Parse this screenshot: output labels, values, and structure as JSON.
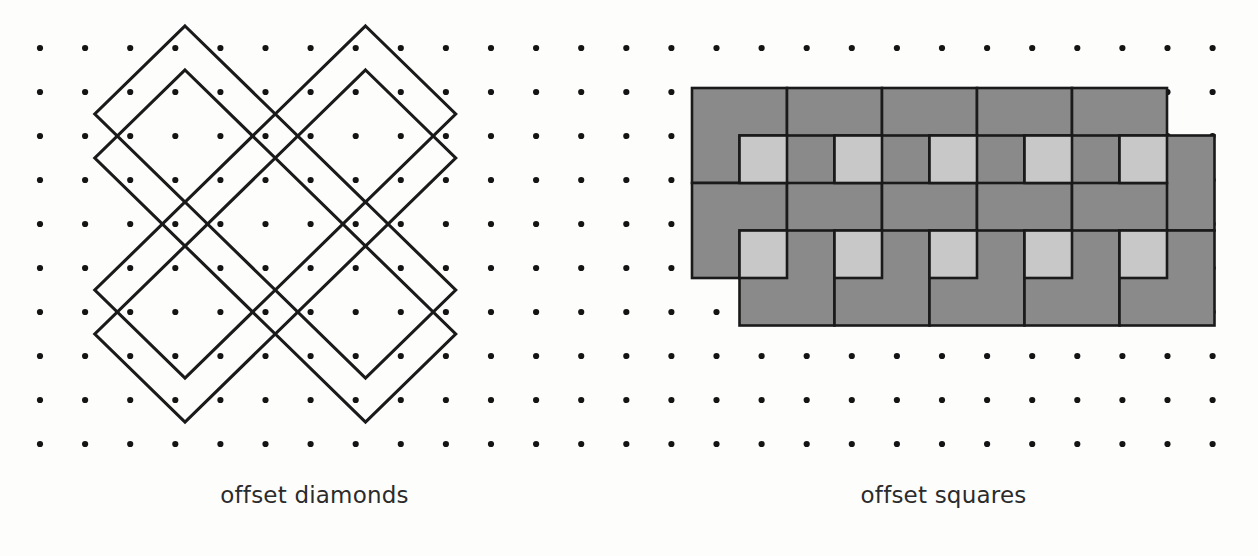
{
  "figure": {
    "background_color": "#fdfdfc",
    "panels": [
      {
        "id": "offset-diamonds",
        "caption": "offset diamonds",
        "kind": "line-drawing",
        "stroke_color": "#1a1a1a",
        "fill_color": "none"
      },
      {
        "id": "offset-squares",
        "caption": "offset squares",
        "kind": "filled-drawing",
        "stroke_color": "#1a1a1a",
        "fill_dark": "#8a8a8a",
        "fill_light": "#c8c8c8"
      }
    ]
  },
  "grid": {
    "dot_color": "#141414",
    "dot_radius": 3.1,
    "cols": 27,
    "rows": 10,
    "x0": 40,
    "y0": 48,
    "dx": 45.1,
    "dy": 44.0
  },
  "chart_data": {
    "type": "diagram",
    "title": "",
    "panels": [
      {
        "name": "offset diamonds",
        "label": "offset diamonds",
        "description": "Four pairs of congruent diamonds drawn on a dot lattice; each pair consists of two identical diamonds offset vertically by one grid unit, producing narrow lens-shaped overlaps.",
        "unit_px": 45.1,
        "diamond_half_width": 90.2,
        "diamond_half_height": 88.0,
        "pair_offset_y": 44.0,
        "pair_centers": [
          {
            "cx": 185.0,
            "cy": 136.0
          },
          {
            "cx": 365.5,
            "cy": 136.0
          },
          {
            "cx": 185.0,
            "cy": 312.0
          },
          {
            "cx": 365.5,
            "cy": 312.0
          }
        ]
      },
      {
        "name": "offset squares",
        "label": "offset squares",
        "description": "A field of congruent shaded squares laid on the same dot lattice but offset horizontally and vertically by half a square, so that adjacent squares overlap; overlap regions render a lighter gray.",
        "square_size": 95.0,
        "offset_step": 47.5,
        "dark_fill": "#8a8a8a",
        "light_fill": "#c8c8c8",
        "rows": 4,
        "columns": 6
      }
    ]
  }
}
